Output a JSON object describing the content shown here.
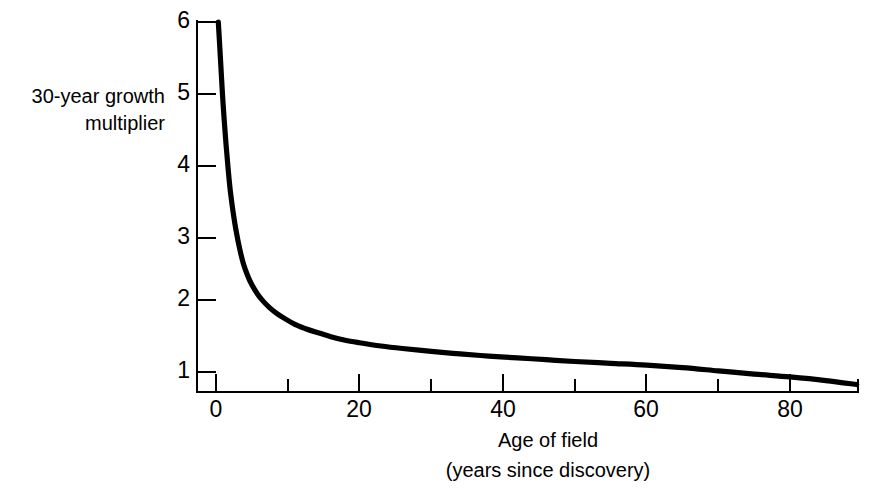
{
  "chart_data": {
    "type": "line",
    "title": "",
    "xlabel": "Age of field",
    "xlabel_sub": "(years since discovery)",
    "ylabel_line1": "30-year growth",
    "ylabel_line2": "multiplier",
    "xlim": [
      0,
      89.5
    ],
    "ylim": [
      0.75,
      6.2
    ],
    "grid": false,
    "legend": false,
    "line_color": "#000000",
    "background_color": "#ffffff",
    "x_ticks_major": [
      0,
      20,
      40,
      60,
      80
    ],
    "x_tick_labels": [
      "0",
      "20",
      "40",
      "60",
      "80"
    ],
    "x_ticks_minor": [
      10,
      30,
      50,
      70
    ],
    "y_ticks_major": [
      1,
      2,
      3,
      4,
      5,
      6
    ],
    "y_tick_labels": [
      "1",
      "2",
      "3",
      "4",
      "5",
      "6"
    ],
    "x": [
      0.32,
      0.5,
      0.7,
      0.9,
      1.1,
      1.4,
      1.7,
      2.0,
      2.4,
      2.8,
      3.3,
      3.8,
      4.4,
      5.0,
      5.8,
      6.6,
      7.5,
      8.5,
      9.6,
      11.0,
      12.5,
      14.0,
      16.0,
      18.0,
      20.0,
      23.0,
      26.0,
      30.0,
      34.0,
      38.0,
      42.0,
      46.0,
      50.0,
      55.0,
      60.0,
      65.0,
      70.0,
      75.0,
      80.0,
      85.0,
      89.3
    ],
    "values": [
      6.0,
      5.7,
      5.35,
      5.0,
      4.7,
      4.3,
      3.95,
      3.65,
      3.35,
      3.1,
      2.85,
      2.65,
      2.48,
      2.35,
      2.22,
      2.12,
      2.03,
      1.95,
      1.88,
      1.8,
      1.74,
      1.69,
      1.63,
      1.58,
      1.545,
      1.5,
      1.465,
      1.425,
      1.39,
      1.36,
      1.335,
      1.31,
      1.285,
      1.26,
      1.235,
      1.2,
      1.155,
      1.11,
      1.07,
      1.02,
      0.965
    ]
  },
  "figure": {
    "caption": ""
  }
}
